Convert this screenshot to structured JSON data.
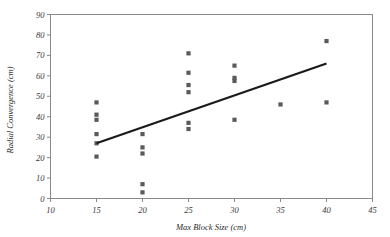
{
  "chart_data": {
    "type": "scatter",
    "title": "",
    "xlabel": "Max Block Size (cm)",
    "ylabel": "Radial Convergence (cm)",
    "xlim": [
      10,
      45
    ],
    "ylim": [
      0,
      90
    ],
    "xticks": [
      10,
      15,
      20,
      25,
      30,
      35,
      40,
      45
    ],
    "yticks": [
      0,
      10,
      20,
      30,
      40,
      50,
      60,
      70,
      80,
      90
    ],
    "xtick_labels": [
      "10",
      "15",
      "20",
      "25",
      "30",
      "35",
      "40",
      "45"
    ],
    "ytick_labels": [
      "0",
      "10",
      "20",
      "30",
      "40",
      "50",
      "60",
      "70",
      "80",
      "90"
    ],
    "grid": false,
    "legend": false,
    "marker_color": "#5a5a5a",
    "trendline_color": "#1a1a1a",
    "frame_color": "#8a8a8a",
    "series": [
      {
        "name": "Observations",
        "points": [
          [
            15,
            47
          ],
          [
            15,
            41
          ],
          [
            15,
            38.5
          ],
          [
            15,
            31.5
          ],
          [
            15,
            27
          ],
          [
            15,
            20.5
          ],
          [
            20,
            31.5
          ],
          [
            20,
            25
          ],
          [
            20,
            22
          ],
          [
            20,
            7
          ],
          [
            20,
            3
          ],
          [
            25,
            71
          ],
          [
            25,
            61.5
          ],
          [
            25,
            55.5
          ],
          [
            25,
            52
          ],
          [
            25,
            37
          ],
          [
            25,
            34
          ],
          [
            30,
            65
          ],
          [
            30,
            59
          ],
          [
            30,
            57.5
          ],
          [
            30,
            38.5
          ],
          [
            35,
            46
          ],
          [
            40,
            77
          ],
          [
            40,
            47
          ]
        ]
      }
    ],
    "trendline": {
      "name": "Linear fit",
      "x_start": 15,
      "y_start": 27,
      "x_end": 40,
      "y_end": 66
    }
  }
}
